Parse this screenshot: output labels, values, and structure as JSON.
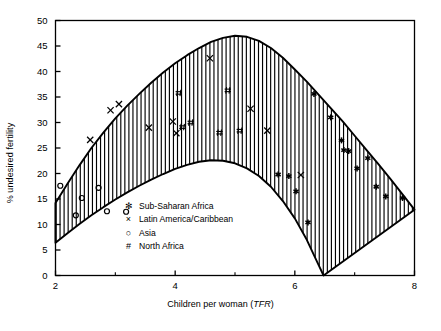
{
  "chart_data": {
    "type": "scatter",
    "title": "",
    "xlabel": "Children per woman (TFR)",
    "xlabel_plain": "Children per woman (",
    "xlabel_italic": "TFR",
    "xlabel_tail": ")",
    "ylabel": "% undesired fertility",
    "xlim": [
      2,
      8
    ],
    "ylim": [
      0,
      50
    ],
    "xticks": [
      2,
      4,
      6,
      8
    ],
    "xticks_minor": [
      3,
      5,
      7
    ],
    "yticks": [
      0,
      5,
      10,
      15,
      20,
      25,
      30,
      35,
      40,
      45,
      50
    ],
    "grid": false,
    "legend_position": "inside-bottom-left",
    "band": {
      "name": "Range of undesired fertility",
      "fill": "vertical-hatch",
      "hatch_color": "#000000",
      "line_color": "#000000",
      "upper_curve": [
        {
          "x": 2.0,
          "y": 14.2
        },
        {
          "x": 2.2,
          "y": 18.0
        },
        {
          "x": 2.4,
          "y": 21.6
        },
        {
          "x": 2.6,
          "y": 25.0
        },
        {
          "x": 2.8,
          "y": 28.0
        },
        {
          "x": 3.0,
          "y": 30.8
        },
        {
          "x": 3.2,
          "y": 33.3
        },
        {
          "x": 3.4,
          "y": 35.6
        },
        {
          "x": 3.6,
          "y": 37.8
        },
        {
          "x": 3.8,
          "y": 39.8
        },
        {
          "x": 4.0,
          "y": 41.6
        },
        {
          "x": 4.2,
          "y": 43.2
        },
        {
          "x": 4.4,
          "y": 44.6
        },
        {
          "x": 4.6,
          "y": 45.8
        },
        {
          "x": 4.8,
          "y": 46.6
        },
        {
          "x": 5.0,
          "y": 47.0
        },
        {
          "x": 5.2,
          "y": 46.8
        },
        {
          "x": 5.4,
          "y": 46.0
        },
        {
          "x": 5.6,
          "y": 44.6
        },
        {
          "x": 5.8,
          "y": 42.7
        },
        {
          "x": 6.0,
          "y": 40.4
        },
        {
          "x": 6.2,
          "y": 38.0
        },
        {
          "x": 6.4,
          "y": 35.4
        },
        {
          "x": 6.6,
          "y": 32.8
        },
        {
          "x": 6.8,
          "y": 30.2
        },
        {
          "x": 7.0,
          "y": 27.4
        },
        {
          "x": 7.2,
          "y": 24.6
        },
        {
          "x": 7.4,
          "y": 21.8
        },
        {
          "x": 7.6,
          "y": 18.9
        },
        {
          "x": 7.8,
          "y": 15.9
        },
        {
          "x": 8.0,
          "y": 12.9
        }
      ],
      "lower_curve": [
        {
          "x": 2.0,
          "y": 6.4
        },
        {
          "x": 2.2,
          "y": 8.3
        },
        {
          "x": 2.4,
          "y": 10.1
        },
        {
          "x": 2.6,
          "y": 11.8
        },
        {
          "x": 2.8,
          "y": 13.4
        },
        {
          "x": 3.0,
          "y": 14.9
        },
        {
          "x": 3.2,
          "y": 16.3
        },
        {
          "x": 3.4,
          "y": 17.6
        },
        {
          "x": 3.6,
          "y": 18.8
        },
        {
          "x": 3.8,
          "y": 19.9
        },
        {
          "x": 4.0,
          "y": 20.9
        },
        {
          "x": 4.2,
          "y": 21.7
        },
        {
          "x": 4.4,
          "y": 22.3
        },
        {
          "x": 4.6,
          "y": 22.6
        },
        {
          "x": 4.8,
          "y": 22.5
        },
        {
          "x": 5.0,
          "y": 22.0
        },
        {
          "x": 5.2,
          "y": 21.0
        },
        {
          "x": 5.4,
          "y": 19.5
        },
        {
          "x": 5.6,
          "y": 17.4
        },
        {
          "x": 5.8,
          "y": 14.6
        },
        {
          "x": 6.0,
          "y": 11.2
        },
        {
          "x": 6.2,
          "y": 7.0
        },
        {
          "x": 6.4,
          "y": 2.0
        },
        {
          "x": 6.48,
          "y": 0.0
        }
      ]
    },
    "series": [
      {
        "name": "Sub-Saharan Africa",
        "marker": "asterisk",
        "marker_glyph": "✻",
        "points": [
          {
            "x": 6.32,
            "y": 35.6
          },
          {
            "x": 6.6,
            "y": 31.0
          },
          {
            "x": 6.78,
            "y": 26.5
          },
          {
            "x": 6.82,
            "y": 24.6
          },
          {
            "x": 6.9,
            "y": 24.4
          },
          {
            "x": 7.04,
            "y": 21.0
          },
          {
            "x": 7.22,
            "y": 23.0
          },
          {
            "x": 7.36,
            "y": 17.4
          },
          {
            "x": 7.52,
            "y": 15.5
          },
          {
            "x": 6.02,
            "y": 16.5
          },
          {
            "x": 5.72,
            "y": 19.8
          },
          {
            "x": 5.9,
            "y": 19.5
          },
          {
            "x": 6.22,
            "y": 10.4
          },
          {
            "x": 7.8,
            "y": 15.2
          }
        ]
      },
      {
        "name": "Latin America/Caribbean",
        "marker": "x",
        "marker_glyph": "×",
        "points": [
          {
            "x": 2.58,
            "y": 26.6
          },
          {
            "x": 2.92,
            "y": 32.4
          },
          {
            "x": 3.06,
            "y": 33.6
          },
          {
            "x": 3.56,
            "y": 29.0
          },
          {
            "x": 4.02,
            "y": 27.9
          },
          {
            "x": 4.58,
            "y": 42.6
          },
          {
            "x": 5.26,
            "y": 32.7
          },
          {
            "x": 5.54,
            "y": 28.4
          },
          {
            "x": 6.1,
            "y": 19.7
          },
          {
            "x": 3.96,
            "y": 30.2
          }
        ]
      },
      {
        "name": "Asia",
        "marker": "circle",
        "marker_glyph": "○",
        "points": [
          {
            "x": 2.08,
            "y": 17.6
          },
          {
            "x": 2.44,
            "y": 15.2
          },
          {
            "x": 2.72,
            "y": 17.2
          },
          {
            "x": 2.34,
            "y": 11.8
          },
          {
            "x": 2.86,
            "y": 12.6
          },
          {
            "x": 3.18,
            "y": 12.5
          }
        ]
      },
      {
        "name": "North Africa",
        "marker": "hash",
        "marker_glyph": "#",
        "points": [
          {
            "x": 4.06,
            "y": 35.8
          },
          {
            "x": 4.26,
            "y": 30.0
          },
          {
            "x": 4.12,
            "y": 29.1
          },
          {
            "x": 4.88,
            "y": 36.3
          },
          {
            "x": 5.08,
            "y": 28.4
          },
          {
            "x": 4.74,
            "y": 28.0
          }
        ]
      }
    ]
  },
  "legend": {
    "items": [
      {
        "glyph": "✻",
        "label": "Sub-Saharan Africa"
      },
      {
        "glyph": "×",
        "label": "Latin America/Caribbean"
      },
      {
        "glyph": "○",
        "label": "Asia"
      },
      {
        "glyph": "#",
        "label": "North Africa"
      }
    ]
  }
}
